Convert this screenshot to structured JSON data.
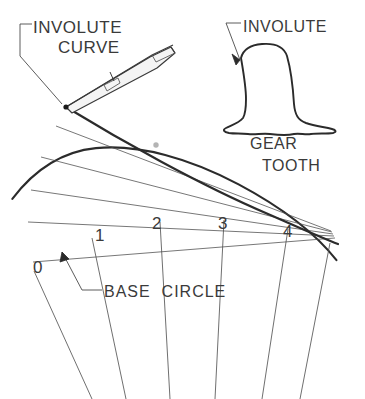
{
  "figure": {
    "background_color": "#ffffff",
    "ink_color": "#2b2b2b",
    "text_color": "#3a3a3a"
  },
  "labels": {
    "involute_curve_line1": "INVOLUTE",
    "involute_curve_line2": "CURVE",
    "involute_tooth": "INVOLUTE",
    "gear": "GEAR",
    "tooth": "TOOTH",
    "base_circle": "BASE  CIRCLE"
  },
  "ticks": [
    {
      "label": "0"
    },
    {
      "label": "1"
    },
    {
      "label": "2"
    },
    {
      "label": "3"
    },
    {
      "label": "4"
    }
  ]
}
